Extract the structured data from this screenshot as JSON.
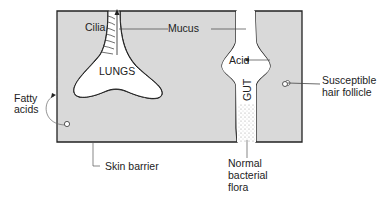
{
  "diagram": {
    "colors": {
      "tissue_fill": "#d9d9d9",
      "outline": "#222222",
      "background": "#ffffff",
      "leader": "#444444"
    },
    "labels": {
      "cilia": "Cilia",
      "mucus": "Mucus",
      "lungs": "LUNGS",
      "acid": "Acid",
      "gut": "GUT",
      "fatty_line1": "Fatty",
      "fatty_line2": "acids",
      "susceptible_line1": "Susceptible",
      "susceptible_line2": "hair follicle",
      "skin_barrier": "Skin barrier",
      "flora_line1": "Normal",
      "flora_line2": "bacterial",
      "flora_line3": "flora"
    }
  }
}
